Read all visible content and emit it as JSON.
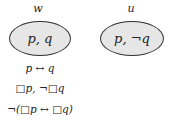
{
  "worlds": [
    {
      "name": "w",
      "content": "p, q"
    },
    {
      "name": "u",
      "content": "p, ¬q"
    }
  ],
  "formulas": [
    "p ↔ q",
    "□p, ¬□q",
    "¬(□p ↔ □q)"
  ]
}
